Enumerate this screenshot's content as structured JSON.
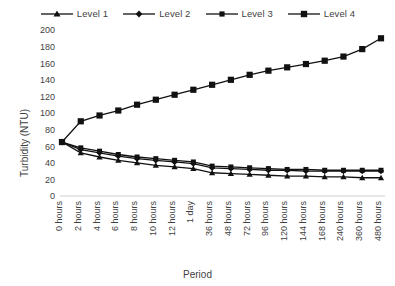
{
  "chart_data": {
    "type": "line",
    "title": "",
    "xlabel": "Period",
    "ylabel": "Turbidity (NTU)",
    "ylim": [
      0,
      200
    ],
    "ytick_step": 20,
    "yticks": [
      0,
      20,
      40,
      60,
      80,
      100,
      120,
      140,
      160,
      180,
      200
    ],
    "grid": false,
    "legend_position": "top",
    "categories": [
      "0 hours",
      "2 hours",
      "4 hours",
      "6 hours",
      "8 hours",
      "10 hours",
      "12 hours",
      "1 day",
      "36 hours",
      "48 hours",
      "72 hours",
      "96 hours",
      "120 hours",
      "144 hours",
      "168 hours",
      "240 hours",
      "360 hours",
      "480 hours"
    ],
    "series": [
      {
        "name": "Level 1",
        "marker": "triangle",
        "color": "#111111",
        "values": [
          65,
          52,
          47,
          43,
          40,
          37,
          35,
          33,
          28,
          27,
          26,
          25,
          24,
          24,
          23,
          23,
          22,
          22
        ]
      },
      {
        "name": "Level 2",
        "marker": "diamond",
        "color": "#111111",
        "values": [
          65,
          56,
          52,
          48,
          45,
          43,
          41,
          39,
          34,
          33,
          32,
          31,
          31,
          30,
          30,
          30,
          30,
          30
        ]
      },
      {
        "name": "Level 3",
        "marker": "square-small",
        "color": "#111111",
        "values": [
          65,
          58,
          54,
          50,
          47,
          45,
          43,
          41,
          36,
          35,
          34,
          33,
          32,
          32,
          31,
          31,
          31,
          31
        ]
      },
      {
        "name": "Level 4",
        "marker": "square",
        "color": "#111111",
        "values": [
          65,
          90,
          97,
          103,
          110,
          116,
          122,
          128,
          134,
          140,
          146,
          151,
          155,
          159,
          163,
          168,
          177,
          190
        ]
      }
    ]
  },
  "legend": {
    "entries": [
      {
        "label": "Level 1"
      },
      {
        "label": "Level 2"
      },
      {
        "label": "Level 3"
      },
      {
        "label": "Level 4"
      }
    ]
  }
}
